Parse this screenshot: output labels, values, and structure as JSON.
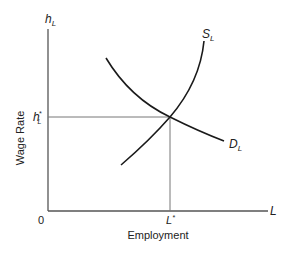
{
  "diagram": {
    "y_axis": {
      "symbol": "h",
      "symbol_sub": "L",
      "label": "Wage Rate"
    },
    "x_axis": {
      "symbol": "L",
      "label": "Employment"
    },
    "origin": "0",
    "equilibrium": {
      "wage_symbol": "h",
      "wage_sub": "L",
      "wage_sup": "*",
      "employment_symbol": "L",
      "employment_sup": "*"
    },
    "curves": [
      {
        "name": "supply",
        "symbol": "S",
        "sub": "L"
      },
      {
        "name": "demand",
        "symbol": "D",
        "sub": "L"
      }
    ],
    "colors": {
      "axis": "#555555",
      "curve": "#1a1a1a",
      "guide": "#777777"
    }
  }
}
